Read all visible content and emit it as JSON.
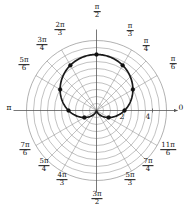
{
  "figure": {
    "kind": "polar-plot",
    "background_color": "#ffffff",
    "grid_color": "#8a8a8a",
    "axis_color": "#555555",
    "curve_color": "#1a1a1a",
    "point_color": "#111111"
  },
  "axis_labels": {
    "right": {
      "text": "0",
      "angle_deg": 0
    },
    "left": {
      "text": "π",
      "angle_deg": 180
    },
    "top": {
      "num": "π",
      "den": "2",
      "angle_deg": 90
    },
    "bottom": {
      "num": "3π",
      "den": "2",
      "angle_deg": 270
    }
  },
  "angle_labels": [
    {
      "name": "pi-over-6",
      "num": "π",
      "den": "6",
      "angle_deg": 30,
      "x": 173,
      "y": 64
    },
    {
      "name": "pi-over-4",
      "num": "π",
      "den": "4",
      "angle_deg": 45,
      "x": 146,
      "y": 46
    },
    {
      "name": "pi-over-3",
      "num": "π",
      "den": "3",
      "angle_deg": 60,
      "x": 130,
      "y": 31
    },
    {
      "name": "2pi-over-3",
      "num": "2π",
      "den": "3",
      "angle_deg": 120,
      "x": 60,
      "y": 30
    },
    {
      "name": "3pi-over-4",
      "num": "3π",
      "den": "4",
      "angle_deg": 135,
      "x": 42,
      "y": 45
    },
    {
      "name": "5pi-over-6",
      "num": "5π",
      "den": "6",
      "angle_deg": 150,
      "x": 24,
      "y": 65
    },
    {
      "name": "7pi-over-6",
      "num": "7π",
      "den": "6",
      "angle_deg": 210,
      "x": 25,
      "y": 150
    },
    {
      "name": "5pi-over-4",
      "num": "5π",
      "den": "4",
      "angle_deg": 225,
      "x": 44,
      "y": 166
    },
    {
      "name": "4pi-over-3",
      "num": "4π",
      "den": "3",
      "angle_deg": 240,
      "x": 62,
      "y": 180
    },
    {
      "name": "5pi-over-3",
      "num": "5π",
      "den": "3",
      "angle_deg": 300,
      "x": 130,
      "y": 180
    },
    {
      "name": "7pi-over-4",
      "num": "7π",
      "den": "4",
      "angle_deg": 315,
      "x": 148,
      "y": 166
    },
    {
      "name": "11pi-over-6",
      "num": "11π",
      "den": "6",
      "angle_deg": 330,
      "x": 168,
      "y": 150
    }
  ],
  "radial_ticks": [
    {
      "label": "2",
      "r": 2,
      "x": 122,
      "y": 112
    },
    {
      "label": "4",
      "r": 4,
      "x": 148,
      "y": 112
    }
  ],
  "chart_data": {
    "type": "line",
    "subtype": "polar-cardioid",
    "title": "",
    "xlabel": "",
    "ylabel": "",
    "rlim": [
      0,
      5
    ],
    "grid": true,
    "legend": false,
    "grid_rings_r": [
      0.5,
      1,
      1.5,
      2,
      2.5,
      3,
      3.5,
      4,
      4.5,
      5
    ],
    "grid_spokes_deg": [
      0,
      30,
      45,
      60,
      90,
      120,
      135,
      150,
      180,
      210,
      225,
      240,
      270,
      300,
      315,
      330
    ],
    "equation": "r = 2 + 2 sin(theta)",
    "theta_deg": [
      0,
      15,
      30,
      45,
      60,
      75,
      90,
      105,
      120,
      135,
      150,
      165,
      180,
      195,
      210,
      225,
      240,
      255,
      270,
      285,
      300,
      315,
      330,
      345,
      360
    ],
    "r_values": [
      2,
      2.52,
      3,
      3.41,
      3.73,
      3.93,
      4,
      3.93,
      3.73,
      3.41,
      3,
      2.52,
      2,
      1.48,
      1,
      0.59,
      0.27,
      0.07,
      0,
      0.07,
      0.27,
      0.59,
      1,
      1.48,
      2
    ],
    "marked_points": [
      {
        "theta_deg": 0,
        "r": 2
      },
      {
        "theta_deg": 30,
        "r": 3
      },
      {
        "theta_deg": 60,
        "r": 3.73
      },
      {
        "theta_deg": 90,
        "r": 4
      },
      {
        "theta_deg": 120,
        "r": 3.73
      },
      {
        "theta_deg": 150,
        "r": 3
      },
      {
        "theta_deg": 180,
        "r": 2
      },
      {
        "theta_deg": 210,
        "r": 1
      },
      {
        "theta_deg": 330,
        "r": 1
      }
    ]
  }
}
